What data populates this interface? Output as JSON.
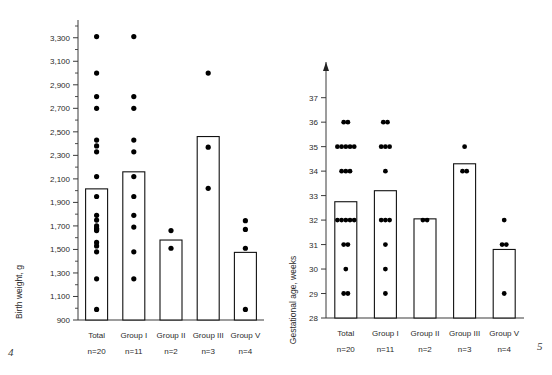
{
  "figure": {
    "page_number_left": "4",
    "page_number_right": "5"
  },
  "chart_data": [
    {
      "id": "birth-weight",
      "type": "bar",
      "title": "",
      "xlabel": "",
      "ylabel": "Birth weight, g",
      "ylim": [
        900,
        3400
      ],
      "ytick_step": 200,
      "ytick_minor_step": 100,
      "grid": false,
      "legend": "none",
      "ytick_labels": [
        "900",
        "1,100",
        "1,300",
        "1,500",
        "1,700",
        "1,900",
        "2,100",
        "2,300",
        "2,500",
        "2,700",
        "2,900",
        "3,100",
        "3,300"
      ],
      "ytick_values": [
        900,
        1100,
        1300,
        1500,
        1700,
        1900,
        2100,
        2300,
        2500,
        2700,
        2900,
        3100,
        3300
      ],
      "categories": [
        "Total",
        "Group I",
        "Group II",
        "Group III",
        "Group V"
      ],
      "category_counts": [
        "n=20",
        "n=11",
        "n=2",
        "n=3",
        "n=4"
      ],
      "values": [
        2015,
        2160,
        1580,
        2460,
        1475
      ],
      "points": [
        {
          "category": "Total",
          "values": [
            3310,
            3000,
            2800,
            2700,
            2430,
            2380,
            2330,
            2120,
            1950,
            1790,
            1750,
            1700,
            1680,
            1670,
            1660,
            1560,
            1530,
            1480,
            1250,
            990
          ]
        },
        {
          "category": "Group I",
          "values": [
            3310,
            2800,
            2700,
            2430,
            2330,
            2120,
            1950,
            1790,
            1690,
            1480,
            1250
          ]
        },
        {
          "category": "Group II",
          "values": [
            1660,
            1510
          ]
        },
        {
          "category": "Group III",
          "values": [
            3000,
            2370,
            2020
          ]
        },
        {
          "category": "Group V",
          "values": [
            1745,
            1670,
            1510,
            990
          ]
        }
      ]
    },
    {
      "id": "gestational-age",
      "type": "bar",
      "title": "",
      "xlabel": "",
      "ylabel": "Gestational age, weeks",
      "ylim": [
        28,
        37.6
      ],
      "ytick_step": 1,
      "grid": false,
      "legend": "none",
      "ytick_labels": [
        "28",
        "29",
        "30",
        "31",
        "32",
        "33",
        "34",
        "35",
        "36",
        "37"
      ],
      "ytick_values": [
        28,
        29,
        30,
        31,
        32,
        33,
        34,
        35,
        36,
        37
      ],
      "categories": [
        "Total",
        "Group I",
        "Group II",
        "Group III",
        "Group V"
      ],
      "category_counts": [
        "n=20",
        "n=11",
        "n=2",
        "n=3",
        "n=4"
      ],
      "values": [
        32.75,
        33.2,
        32.05,
        34.3,
        30.8
      ],
      "points": [
        {
          "category": "Total",
          "values": [
            36,
            36,
            35,
            35,
            35,
            35,
            35,
            34,
            34,
            34,
            32,
            32,
            32,
            32,
            32,
            31,
            31,
            30,
            29,
            29
          ]
        },
        {
          "category": "Group I",
          "values": [
            36,
            36,
            35,
            35,
            35,
            34,
            32,
            32,
            32,
            31,
            30,
            29
          ]
        },
        {
          "category": "Group II",
          "values": [
            32,
            32
          ]
        },
        {
          "category": "Group III",
          "values": [
            35,
            34,
            34
          ]
        },
        {
          "category": "Group V",
          "values": [
            32,
            31,
            31,
            29
          ]
        }
      ]
    }
  ]
}
